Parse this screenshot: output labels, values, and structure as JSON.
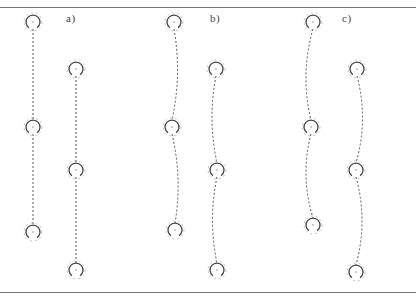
{
  "figure": {
    "width": 416,
    "height": 295,
    "top_rule_y": 7,
    "bottom_rule_y": 292,
    "line_color": "#555555",
    "ring_color": "#444444",
    "panels": [
      {
        "label": "a)",
        "label_pos": [
          66,
          12
        ],
        "chains": [
          {
            "rings": [
              [
                33,
                22
              ],
              [
                33,
                127
              ],
              [
                33,
                232
              ]
            ],
            "curve": 0
          },
          {
            "rings": [
              [
                76,
                69
              ],
              [
                76,
                170
              ],
              [
                76,
                270
              ]
            ],
            "curve": 0
          }
        ]
      },
      {
        "label": "b)",
        "label_pos": [
          210,
          12
        ],
        "chains": [
          {
            "rings": [
              [
                174,
                22
              ],
              [
                172,
                127
              ],
              [
                175,
                230
              ]
            ],
            "curve": 9
          },
          {
            "rings": [
              [
                216,
                69
              ],
              [
                217,
                170
              ],
              [
                217,
                270
              ]
            ],
            "curve": -9
          }
        ]
      },
      {
        "label": "c)",
        "label_pos": [
          342,
          12
        ],
        "chains": [
          {
            "rings": [
              [
                313,
                22
              ],
              [
                311,
                127
              ],
              [
                313,
                225
              ]
            ],
            "curve": -12
          },
          {
            "rings": [
              [
                357,
                69
              ],
              [
                356,
                170
              ],
              [
                356,
                272
              ]
            ],
            "curve": 12
          }
        ]
      }
    ]
  }
}
